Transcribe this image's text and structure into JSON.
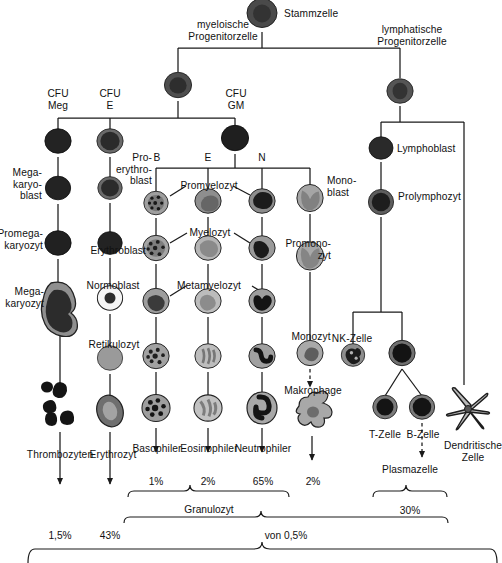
{
  "diagram": {
    "language": "de",
    "labels": {
      "stammzelle": "Stammzelle",
      "myeloische_progenitor": "myeloische\nProgenitorzelle",
      "lymphatische_progenitor": "lymphatische\nProgenitorzelle",
      "cfu_meg": "CFU\nMeg",
      "cfu_e": "CFU\nE",
      "cfu_gm": "CFU\nGM",
      "b": "B",
      "e": "E",
      "n": "N",
      "megakaryoblast": "Mega-\nkaryo-\nblast",
      "promegakaryozyt": "Promega-\nkaryozyt",
      "megakaryozyt": "Mega-\nkaryozyt",
      "thrombozyten": "Thrombozyten",
      "proerythroblast": "Pro-\nerythro-\nblast",
      "erythroblast": "Erythroblast",
      "normoblast": "Normoblast",
      "retikulozyt": "Retikulozyt",
      "erythrozyt": "Erythrozyt",
      "promyelozyt": "Promyelozyt",
      "myelozyt": "Myelozyt",
      "metamyelozyt": "Metamyelozyt",
      "basophiler": "Basophiler",
      "eosinophiler": "Eosinophiler",
      "neutrophiler": "Neutrophiler",
      "monoblast": "Mono-\nblast",
      "promonozyt": "Promono-\nzyt",
      "monozyt": "Monozyt",
      "makrophage": "Makrophage",
      "lymphoblast": "Lymphoblast",
      "prolymphozyt": "Prolymphozyt",
      "nk_zelle": "NK-Zelle",
      "t_zelle": "T-Zelle",
      "b_zelle": "B-Zelle",
      "plasmazelle": "Plasmazelle",
      "dendritische_zelle": "Dendritische\nZelle",
      "granulozyt": "Granulozyt",
      "von_05": "von 0,5%"
    },
    "percentages": {
      "thrombozyten": "1,5%",
      "erythrozyt": "43%",
      "basophiler": "1%",
      "eosinophiler": "2%",
      "neutrophiler": "65%",
      "makrophage": "2%",
      "lymphozyten": "30%"
    },
    "colors": {
      "line": "#1a1a1a",
      "text": "#111111",
      "background": "#ffffff",
      "cell_dark": "#2b2b2b",
      "cell_mid": "#8a8a8a",
      "cell_light": "#d0d0d0"
    },
    "cells": [
      {
        "name": "stammzelle",
        "x": 262,
        "y": 15,
        "type": "blast-ring",
        "size": 30
      },
      {
        "name": "myeloische-progenitorzelle",
        "x": 178,
        "y": 87,
        "type": "blast-ring",
        "size": 27
      },
      {
        "name": "lymphatische-progenitorzelle",
        "x": 400,
        "y": 93,
        "type": "blast-ring",
        "size": 26
      },
      {
        "name": "megakaryoblast-cfu",
        "x": 58,
        "y": 143,
        "type": "dark",
        "size": 27
      },
      {
        "name": "cfu-e-cell",
        "x": 110,
        "y": 143,
        "type": "dark-ring",
        "size": 27
      },
      {
        "name": "cfu-gm-cell",
        "x": 235,
        "y": 140,
        "type": "dark",
        "size": 28
      },
      {
        "name": "megakaryoblast",
        "x": 58,
        "y": 190,
        "type": "dark",
        "size": 26
      },
      {
        "name": "proerythroblast",
        "x": 110,
        "y": 190,
        "type": "dark-ring",
        "size": 25
      },
      {
        "name": "promegakaryozyt",
        "x": 58,
        "y": 245,
        "type": "dark",
        "size": 27
      },
      {
        "name": "erythroblast",
        "x": 110,
        "y": 245,
        "type": "dark",
        "size": 25
      },
      {
        "name": "megakaryozyt",
        "x": 60,
        "y": 310,
        "type": "megakaryocyte",
        "size": 52
      },
      {
        "name": "normoblast",
        "x": 110,
        "y": 300,
        "type": "normoblast",
        "size": 26
      },
      {
        "name": "retikulozyt",
        "x": 110,
        "y": 360,
        "type": "retic",
        "size": 26
      },
      {
        "name": "erythrozyt",
        "x": 110,
        "y": 413,
        "type": "erythrocyte",
        "size": 32
      },
      {
        "name": "thrombozyten",
        "x": 60,
        "y": 405,
        "type": "platelets",
        "size": 46
      },
      {
        "name": "promyelozyt-b",
        "x": 156,
        "y": 205,
        "type": "baso",
        "size": 25
      },
      {
        "name": "promyelozyt-e",
        "x": 208,
        "y": 203,
        "type": "eos",
        "size": 27
      },
      {
        "name": "promyelozyt-n",
        "x": 262,
        "y": 203,
        "type": "neut",
        "size": 27
      },
      {
        "name": "myelozyt-b",
        "x": 156,
        "y": 250,
        "type": "baso",
        "size": 27
      },
      {
        "name": "myelozyt-e",
        "x": 208,
        "y": 250,
        "type": "eos",
        "size": 27
      },
      {
        "name": "myelozyt-n",
        "x": 262,
        "y": 250,
        "type": "neut",
        "size": 27
      },
      {
        "name": "metamyelozyt-b",
        "x": 156,
        "y": 303,
        "type": "baso",
        "size": 27
      },
      {
        "name": "metamyelozyt-e",
        "x": 208,
        "y": 303,
        "type": "eos",
        "size": 27
      },
      {
        "name": "metamyelozyt-n",
        "x": 262,
        "y": 303,
        "type": "neut",
        "size": 27
      },
      {
        "name": "stab-b",
        "x": 156,
        "y": 358,
        "type": "baso",
        "size": 27
      },
      {
        "name": "stab-e",
        "x": 208,
        "y": 358,
        "type": "eos",
        "size": 27
      },
      {
        "name": "stab-n",
        "x": 262,
        "y": 358,
        "type": "neut",
        "size": 27
      },
      {
        "name": "basophiler",
        "x": 156,
        "y": 410,
        "type": "baso",
        "size": 29
      },
      {
        "name": "eosinophiler",
        "x": 208,
        "y": 410,
        "type": "eos",
        "size": 29
      },
      {
        "name": "neutrophiler",
        "x": 262,
        "y": 410,
        "type": "neut",
        "size": 31
      },
      {
        "name": "monoblast",
        "x": 310,
        "y": 200,
        "type": "mono",
        "size": 27
      },
      {
        "name": "promonozyt",
        "x": 310,
        "y": 258,
        "type": "mono",
        "size": 28
      },
      {
        "name": "monozyt",
        "x": 310,
        "y": 355,
        "type": "mono",
        "size": 26
      },
      {
        "name": "makrophage",
        "x": 312,
        "y": 412,
        "type": "macrophage",
        "size": 42
      },
      {
        "name": "lymphoblast",
        "x": 381,
        "y": 150,
        "type": "dark",
        "size": 24
      },
      {
        "name": "prolymphozyt",
        "x": 381,
        "y": 204,
        "type": "dark-ring",
        "size": 25
      },
      {
        "name": "nk-zelle",
        "x": 353,
        "y": 357,
        "type": "nk",
        "size": 24
      },
      {
        "name": "b-cell-progenitor",
        "x": 402,
        "y": 355,
        "type": "lympho",
        "size": 27
      },
      {
        "name": "t-zelle",
        "x": 385,
        "y": 409,
        "type": "lympho",
        "size": 25
      },
      {
        "name": "b-zelle",
        "x": 422,
        "y": 409,
        "type": "lympho",
        "size": 26
      },
      {
        "name": "dendritische-zelle",
        "x": 468,
        "y": 411,
        "type": "dendritic",
        "size": 44
      }
    ]
  }
}
